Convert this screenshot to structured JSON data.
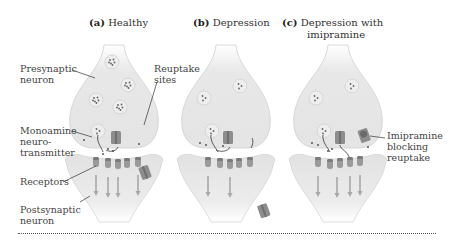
{
  "figure": {
    "panels": [
      {
        "letter": "(a)",
        "title": "Healthy",
        "cx": 114
      },
      {
        "letter": "(b)",
        "title": "Depression",
        "cx": 226
      },
      {
        "letter": "(c)",
        "title": "Depression with",
        "title_line2": "imipramine",
        "cx": 338
      }
    ],
    "labels": {
      "presynaptic": "Presynaptic\nneuron",
      "reuptake_sites": "Reuptake\nsites",
      "monoamine": "Monoamine\nneuro-\ntransmitter",
      "receptors": "Receptors",
      "postsynaptic": "Postsynaptic\nneuron",
      "imipramine": "Imipramine\nblocking\nreuptake"
    },
    "colors": {
      "neuron_fill": "#e6e6e6",
      "neuron_edge": "#c8c8c8",
      "protein": "#8a8a8a",
      "text": "#444444",
      "leader": "#333333"
    },
    "vesicle_counts": {
      "healthy": 5,
      "depression": 3,
      "imipramine": 3
    },
    "receptor_count": 5
  }
}
